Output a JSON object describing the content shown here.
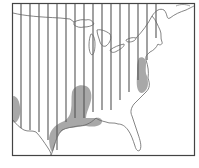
{
  "map": {
    "title": "Eastern United States range map",
    "legend": [
      {
        "pattern": "vertical-hatch",
        "meaning": "hatched range area"
      },
      {
        "pattern": "gray-fill",
        "meaning": "shaded range area"
      }
    ],
    "colors": {
      "background": "#ffffff",
      "frame": "#444444",
      "hatch": "#555555",
      "outline": "#666666",
      "shade": "#a8a8a8"
    },
    "hatch_lines": [
      {
        "x": 21,
        "y1": 4,
        "y2": 128
      },
      {
        "x": 30,
        "y1": 4,
        "y2": 130
      },
      {
        "x": 39,
        "y1": 4,
        "y2": 132
      },
      {
        "x": 48,
        "y1": 4,
        "y2": 140
      },
      {
        "x": 57,
        "y1": 4,
        "y2": 150
      },
      {
        "x": 66,
        "y1": 4,
        "y2": 122
      },
      {
        "x": 75,
        "y1": 4,
        "y2": 118
      },
      {
        "x": 84,
        "y1": 4,
        "y2": 118
      },
      {
        "x": 93,
        "y1": 4,
        "y2": 112
      },
      {
        "x": 102,
        "y1": 4,
        "y2": 110
      },
      {
        "x": 111,
        "y1": 4,
        "y2": 110
      },
      {
        "x": 120,
        "y1": 4,
        "y2": 100
      },
      {
        "x": 129,
        "y1": 4,
        "y2": 92
      },
      {
        "x": 138,
        "y1": 4,
        "y2": 80
      },
      {
        "x": 147,
        "y1": 4,
        "y2": 60
      },
      {
        "x": 156,
        "y1": 4,
        "y2": 38
      }
    ]
  }
}
